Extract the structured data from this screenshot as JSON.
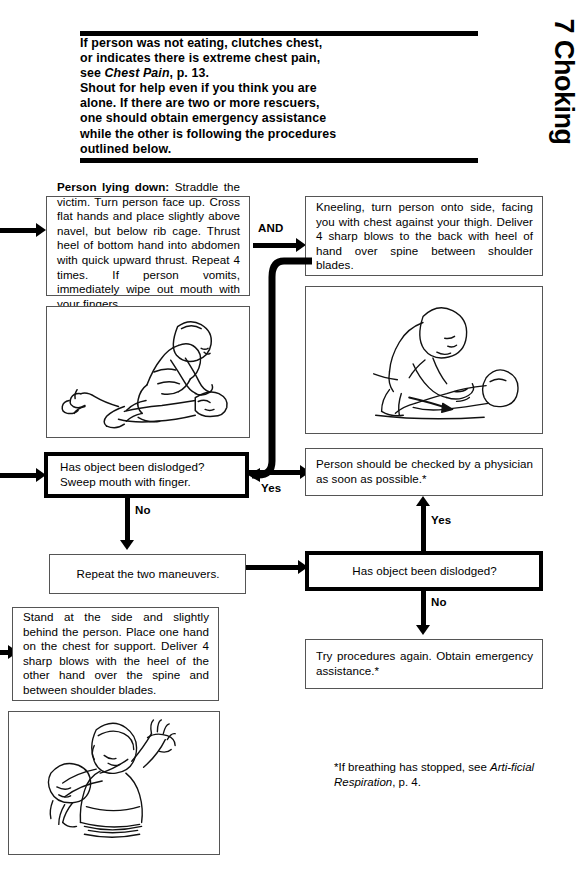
{
  "page": {
    "tab_title": "7 Choking"
  },
  "intro": {
    "line1": "If person was not eating, clutches chest,",
    "line2": "or indicates there is extreme chest pain,",
    "line3_a": "see ",
    "line3_i": "Chest Pain",
    "line3_b": ", p. 13.",
    "line4": "Shout for help even if you think you are",
    "line5": "alone. If there are two or more rescuers,",
    "line6": "one should obtain emergency assistance",
    "line7": "while the other is following the procedures",
    "line8": "outlined below."
  },
  "boxes": {
    "lying_down_lead": "Person lying down:",
    "lying_down_body": " Straddle the victim. Turn person face up. Cross flat hands and place slightly above navel, but below rib cage. Thrust heel of bottom hand into abdomen with quick upward thrust. Repeat 4 times. If person vomits, immediately wipe out mouth with your fingers.",
    "kneeling": "Kneeling, turn person onto side, facing you with chest against your thigh. Deliver 4 sharp blows to the back with heel of hand over spine between shoulder blades.",
    "dislodged_sweep_l1": "Has object been dislodged?",
    "dislodged_sweep_l2": "Sweep mouth with finger.",
    "physician": "Person should be checked by a physician as soon as possible.*",
    "repeat": "Repeat the two maneuvers.",
    "dislodged_2": "Has object been dislodged?",
    "try_again": "Try procedures again. Obtain emergency assistance.*",
    "standing": "Stand at the side and slightly behind the person. Place one hand on the chest for support. Deliver 4 sharp blows with the heel of the other hand over the spine and between shoulder blades."
  },
  "labels": {
    "and": "AND",
    "yes_1": "Yes",
    "no_1": "No",
    "yes_2": "Yes",
    "no_2": "No"
  },
  "footnote": {
    "a": "*If breathing has stopped, see ",
    "i1": "Arti-",
    "i2": "ficial Respiration",
    "b": ", p. 4."
  },
  "illustrations": {
    "straddle": "straddle-victim-illustration",
    "side_blows": "side-back-blows-illustration",
    "standing_blows": "standing-back-blows-illustration"
  },
  "colors": {
    "ink": "#000000",
    "box_border": "#555555",
    "paper": "#ffffff"
  }
}
